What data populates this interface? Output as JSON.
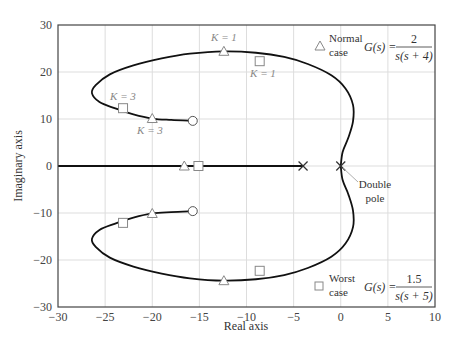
{
  "chart_data": {
    "type": "scatter",
    "title": "",
    "xlabel": "Real axis",
    "ylabel": "Imaginary axis",
    "xlim": [
      -30,
      10
    ],
    "ylim": [
      -30,
      30
    ],
    "xticks": [
      -30,
      -25,
      -20,
      -15,
      -10,
      -5,
      0,
      5,
      10
    ],
    "yticks": [
      -30,
      -20,
      -10,
      0,
      10,
      20,
      30
    ],
    "grid": true,
    "root_locus": {
      "name": "Root locus",
      "upper_branch": [
        [
          -15.7,
          9.6
        ],
        [
          -18,
          9.8
        ],
        [
          -20,
          10.1
        ],
        [
          -22,
          11
        ],
        [
          -24,
          12.3
        ],
        [
          -25.6,
          13.6
        ],
        [
          -26.4,
          15.5
        ],
        [
          -26,
          17.2
        ],
        [
          -24.5,
          19.5
        ],
        [
          -22,
          21.4
        ],
        [
          -19,
          22.9
        ],
        [
          -16,
          23.9
        ],
        [
          -12.4,
          24.4
        ],
        [
          -9,
          24.1
        ],
        [
          -6,
          23.2
        ],
        [
          -3.5,
          21.7
        ],
        [
          -1,
          19.3
        ],
        [
          0.5,
          16.5
        ],
        [
          1.3,
          13
        ],
        [
          1.3,
          9.5
        ],
        [
          0.8,
          6
        ],
        [
          0.2,
          3
        ],
        [
          0,
          0
        ]
      ],
      "lower_branch": [
        [
          -15.7,
          -9.6
        ],
        [
          -18,
          -9.8
        ],
        [
          -20,
          -10.1
        ],
        [
          -22,
          -11
        ],
        [
          -24,
          -12.3
        ],
        [
          -25.6,
          -13.6
        ],
        [
          -26.4,
          -15.5
        ],
        [
          -26,
          -17.2
        ],
        [
          -24.5,
          -19.5
        ],
        [
          -22,
          -21.4
        ],
        [
          -19,
          -22.9
        ],
        [
          -16,
          -23.9
        ],
        [
          -12.4,
          -24.4
        ],
        [
          -9,
          -24.1
        ],
        [
          -6,
          -23.2
        ],
        [
          -3.5,
          -21.7
        ],
        [
          -1,
          -19.3
        ],
        [
          0.5,
          -16.5
        ],
        [
          1.3,
          -13
        ],
        [
          1.3,
          -9.5
        ],
        [
          0.8,
          -6
        ],
        [
          0.2,
          -3
        ],
        [
          0,
          0
        ]
      ],
      "real_axis_segment": [
        [
          -30,
          0
        ],
        [
          -4,
          0
        ]
      ]
    },
    "poles": [
      {
        "label": "pole",
        "re": -4,
        "im": 0,
        "marker": "x"
      },
      {
        "label": "Double pole",
        "re": 0,
        "im": 0,
        "marker": "x"
      }
    ],
    "zeros": [
      {
        "re": -15.7,
        "im": 9.6,
        "marker": "o"
      },
      {
        "re": -15.7,
        "im": -9.6,
        "marker": "o"
      }
    ],
    "series": [
      {
        "name": "Normal case",
        "marker": "triangle",
        "transfer_function": "G(s) = 2 / s(s + 4)",
        "points": [
          {
            "re": -12.4,
            "im": 24.4,
            "label": "K = 1"
          },
          {
            "re": -20,
            "im": 10.1,
            "label": "K = 3"
          },
          {
            "re": -16.6,
            "im": 0
          },
          {
            "re": -20,
            "im": -10.1
          },
          {
            "re": -12.4,
            "im": -24.4
          }
        ]
      },
      {
        "name": "Worst case",
        "marker": "square",
        "transfer_function": "G(s) = 1.5 / s(s + 5)",
        "points": [
          {
            "re": -8.6,
            "im": 22.3,
            "label": "K = 1"
          },
          {
            "re": -23.1,
            "im": 12.3,
            "label": "K = 3"
          },
          {
            "re": -15.1,
            "im": 0
          },
          {
            "re": -23.1,
            "im": -12.1
          },
          {
            "re": -8.6,
            "im": -22.3
          }
        ]
      }
    ],
    "annotations": [
      {
        "text": "K = 1",
        "near": "normal triangle upper"
      },
      {
        "text": "K = 1",
        "near": "worst square upper"
      },
      {
        "text": "K = 3",
        "near": "worst square upper-left"
      },
      {
        "text": "K = 3",
        "near": "normal triangle upper-left"
      },
      {
        "text": "Double pole",
        "at": [
          0,
          0
        ]
      }
    ],
    "legend": {
      "normal": {
        "line1": "Normal",
        "line2": "case",
        "gs": "G(s) =",
        "num": "2",
        "den": "s(s + 4)"
      },
      "worst": {
        "line1": "Worst",
        "line2": "case",
        "gs": "G(s) =",
        "num": "1.5",
        "den": "s(s + 5)"
      }
    },
    "labels": {
      "double_pole_1": "Double",
      "double_pole_2": "pole",
      "k1_tri": "K = 1",
      "k1_sq": "K = 1",
      "k3_sq": "K = 3",
      "k3_tri": "K = 3"
    }
  }
}
